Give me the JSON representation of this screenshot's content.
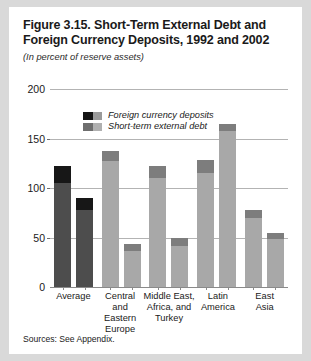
{
  "figure": {
    "title": "Figure 3.15. Short-Term External Debt and Foreign Currency Deposits, 1992 and 2002",
    "subtitle": "(In percent of reserve assets)",
    "source_note": "Sources: See Appendix."
  },
  "colors": {
    "deposits_dark": "#1a1a1a",
    "deposits_average": "#171717",
    "debt_average": "#4d4d4d",
    "debt_region": "#a8a8a8",
    "deposits_region": "#7d7d7d",
    "gridline": "#b3b3b3",
    "panel_background": "#ffffff",
    "page_background": "#d9d9d9"
  },
  "chart_data": {
    "type": "bar",
    "title": "Figure 3.15. Short-Term External Debt and Foreign Currency Deposits, 1992 and 2002",
    "subtitle": "(In percent of reserve assets)",
    "xlabel": "",
    "ylabel": "",
    "ylim": [
      0,
      200
    ],
    "yticks": [
      0,
      50,
      100,
      150,
      200
    ],
    "grid": true,
    "legend_position": "top-left-inside",
    "stacked": true,
    "legend": [
      "Foreign currency deposits",
      "Short-term external debt"
    ],
    "categories": [
      "Average",
      "Central and Eastern Europe",
      "Middle East, Africa, and Turkey",
      "Latin America",
      "East Asia"
    ],
    "category_lines": [
      [
        "Average"
      ],
      [
        "Central",
        "and",
        "Eastern",
        "Europe"
      ],
      [
        "Middle East,",
        "Africa, and",
        "Turkey"
      ],
      [
        "Latin",
        "America"
      ],
      [
        "East",
        "Asia"
      ]
    ],
    "subgroups": [
      "1992",
      "2002"
    ],
    "series": [
      {
        "name": "Short-term external debt",
        "values": [
          [
            105,
            78
          ],
          [
            127,
            36
          ],
          [
            110,
            41
          ],
          [
            115,
            158
          ],
          [
            70,
            49
          ]
        ]
      },
      {
        "name": "Foreign currency deposits",
        "values": [
          [
            17,
            12
          ],
          [
            10,
            7
          ],
          [
            12,
            9
          ],
          [
            13,
            7
          ],
          [
            8,
            6
          ]
        ]
      }
    ],
    "totals": [
      [
        122,
        90
      ],
      [
        137,
        43
      ],
      [
        122,
        50
      ],
      [
        128,
        165
      ],
      [
        78,
        55
      ]
    ]
  }
}
